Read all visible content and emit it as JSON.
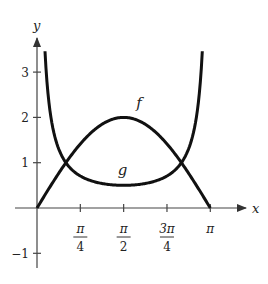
{
  "chart_data": {
    "type": "line",
    "title": "",
    "xlabel": "x",
    "ylabel": "y",
    "xlim": [
      0,
      3.1416
    ],
    "ylim": [
      -1.3,
      3.6
    ],
    "x_ticks": [
      {
        "value": 0.7854,
        "num": "π",
        "den": "4"
      },
      {
        "value": 1.5708,
        "num": "π",
        "den": "2"
      },
      {
        "value": 2.3562,
        "num": "3π",
        "den": "4"
      },
      {
        "value": 3.1416,
        "num": "π",
        "den": ""
      }
    ],
    "y_ticks": [
      {
        "value": 3,
        "label": "3"
      },
      {
        "value": 2,
        "label": "2"
      },
      {
        "value": 1,
        "label": "1"
      },
      {
        "value": -1,
        "label": "−1"
      }
    ],
    "grid": false,
    "legend": "none (curves labeled inline)",
    "series": [
      {
        "name": "f",
        "formula": "2 sin x",
        "x": [
          0,
          0.3927,
          0.5236,
          0.7854,
          1.1781,
          1.5708,
          1.9635,
          2.3562,
          2.618,
          2.7489,
          3.1416
        ],
        "y": [
          0,
          0.765,
          1.0,
          1.414,
          1.848,
          2.0,
          1.848,
          1.414,
          1.0,
          0.765,
          0
        ]
      },
      {
        "name": "g",
        "formula": "(1/2) csc x",
        "x": [
          0.145,
          0.3927,
          0.5236,
          0.7854,
          1.1781,
          1.5708,
          1.9635,
          2.3562,
          2.618,
          2.7489,
          2.9966
        ],
        "y": [
          3.46,
          1.307,
          1.0,
          0.707,
          0.541,
          0.5,
          0.541,
          0.707,
          1.0,
          1.307,
          3.46
        ]
      }
    ],
    "annotations": [
      {
        "text": "f",
        "x": 1.85,
        "y": 2.2
      },
      {
        "text": "g",
        "x": 1.55,
        "y": 0.72
      }
    ],
    "intersections": [
      {
        "x": 0.5236,
        "y": 1
      },
      {
        "x": 2.618,
        "y": 1
      }
    ]
  },
  "labels": {
    "x_axis": "x",
    "y_axis": "y",
    "f": "f",
    "g": "g"
  }
}
